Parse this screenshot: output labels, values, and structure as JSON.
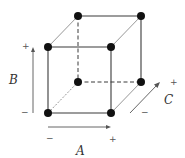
{
  "diagram": {
    "factors": [
      {
        "name": "A",
        "low": "−",
        "high": "+",
        "direction": "horizontal"
      },
      {
        "name": "B",
        "low": "−",
        "high": "+",
        "direction": "vertical"
      },
      {
        "name": "C",
        "low": "−",
        "high": "+",
        "direction": "depth"
      }
    ],
    "labels": {
      "A": "A",
      "B": "B",
      "C": "C",
      "A_low": "−",
      "A_high": "+",
      "B_low": "−",
      "B_high": "+",
      "C_low": "−",
      "C_high": "+"
    },
    "vertices": [
      {
        "id": "front-bottom-left",
        "x": 48,
        "y": 113
      },
      {
        "id": "front-bottom-right",
        "x": 111,
        "y": 113
      },
      {
        "id": "front-top-left",
        "x": 48,
        "y": 47
      },
      {
        "id": "front-top-right",
        "x": 111,
        "y": 47
      },
      {
        "id": "back-bottom-left",
        "x": 78,
        "y": 82
      },
      {
        "id": "back-bottom-right",
        "x": 141,
        "y": 82
      },
      {
        "id": "back-top-left",
        "x": 78,
        "y": 16
      },
      {
        "id": "back-top-right",
        "x": 141,
        "y": 16
      }
    ],
    "colors": {
      "vertex": "#111111",
      "edge": "#3a3a3a",
      "arrow": "#555555",
      "background": "#ffffff"
    }
  }
}
